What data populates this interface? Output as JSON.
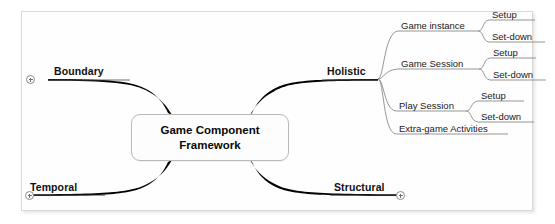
{
  "diagram": {
    "type": "mind-map",
    "background_color": "#ffffff",
    "frame_border_color": "#d8d8d8",
    "branch_color": "#000000",
    "subbranch_color": "#7a7a7a",
    "root": {
      "label": "Game Component\nFramework",
      "label_line1": "Game Component",
      "label_line2": "Framework"
    },
    "branches": [
      {
        "label": "Boundary",
        "side": "left",
        "position": "upper",
        "collapsed": true,
        "icon": "expand-plus-icon"
      },
      {
        "label": "Temporal",
        "side": "left",
        "position": "lower",
        "collapsed": true,
        "icon": "expand-plus-icon"
      },
      {
        "label": "Holistic",
        "side": "right",
        "position": "upper",
        "collapsed": false,
        "children": [
          {
            "label": "Game instance",
            "children": [
              {
                "label": "Setup"
              },
              {
                "label": "Set-down"
              }
            ]
          },
          {
            "label": "Game Session",
            "children": [
              {
                "label": "Setup"
              },
              {
                "label": "Set-down"
              }
            ]
          },
          {
            "label": "Play Session",
            "children": [
              {
                "label": "Setup"
              },
              {
                "label": "Set-down"
              }
            ]
          },
          {
            "label": "Extra-game Activities",
            "children": []
          }
        ]
      },
      {
        "label": "Structural",
        "side": "right",
        "position": "lower",
        "collapsed": true,
        "icon": "expand-plus-icon"
      }
    ]
  }
}
